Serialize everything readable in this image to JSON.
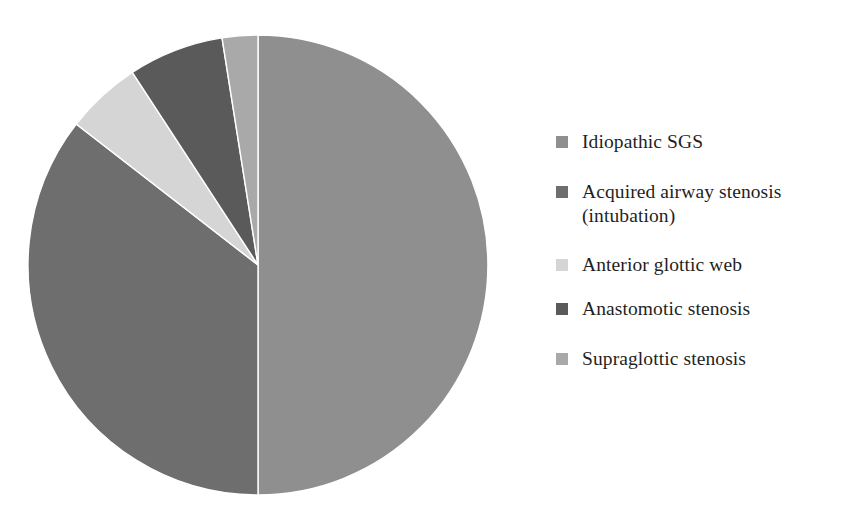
{
  "chart_data": {
    "type": "pie",
    "title": "",
    "subtitle": "",
    "xlabel": "",
    "ylabel": "",
    "grid": false,
    "legend_position": "right",
    "start_angle_deg": 0,
    "direction": "clockwise",
    "categories": [
      "Idiopathic SGS",
      "Acquired airway stenosis (intubation)",
      "Anterior glottic web",
      "Anastomotic stenosis",
      "Supraglottic stenosis"
    ],
    "values": [
      50.0,
      35.5,
      5.3,
      6.7,
      2.5
    ],
    "units": "percent",
    "slice_angles_deg": [
      180.0,
      127.8,
      19.1,
      24.1,
      9.0
    ],
    "colors": [
      "#8f8f8f",
      "#6e6e6e",
      "#d5d5d5",
      "#5a5a5a",
      "#a9a9a9"
    ],
    "slice_boundaries_deg": [
      0,
      180,
      307.8,
      326.9,
      351.0,
      360
    ],
    "annotations": []
  },
  "chart": {
    "center_x": 258,
    "center_y": 265,
    "radius": 230,
    "background": "#ffffff",
    "separator_color": "#ffffff"
  },
  "legend": {
    "items": [
      {
        "label": "Idiopathic SGS",
        "color": "#8f8f8f",
        "swatch_name": "legend-swatch-idiopathic-sgs"
      },
      {
        "label": "Acquired airway stenosis\n(intubation)",
        "color": "#6e6e6e",
        "swatch_name": "legend-swatch-acquired-airway-stenosis"
      },
      {
        "label": "Anterior glottic web",
        "color": "#d5d5d5",
        "swatch_name": "legend-swatch-anterior-glottic-web"
      },
      {
        "label": "Anastomotic stenosis",
        "color": "#5a5a5a",
        "swatch_name": "legend-swatch-anastomotic-stenosis"
      },
      {
        "label": "Supraglottic stenosis",
        "color": "#a9a9a9",
        "swatch_name": "legend-swatch-supraglottic-stenosis"
      }
    ]
  }
}
